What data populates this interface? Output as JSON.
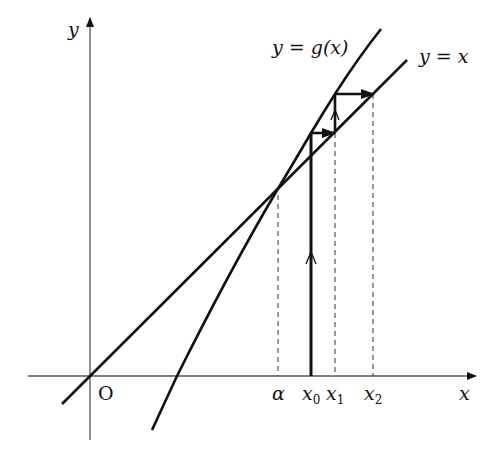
{
  "diagram": {
    "axes": {
      "x_label": "x",
      "y_label": "y",
      "origin_label": "O"
    },
    "curves": [
      {
        "name": "g",
        "label": "y = g(x)",
        "label_var": "y",
        "label_eq": "=",
        "label_rhs": "g(x)"
      },
      {
        "name": "identity",
        "label": "y = x",
        "label_var": "y",
        "label_eq": "=",
        "label_rhs": "x"
      }
    ],
    "x_ticks": {
      "alpha": "α",
      "x0": "x",
      "x0_sub": "0",
      "x1": "x",
      "x1_sub": "1",
      "x2": "x",
      "x2_sub": "2"
    },
    "colors": {
      "ink": "#111111",
      "axis": "#555555"
    }
  }
}
